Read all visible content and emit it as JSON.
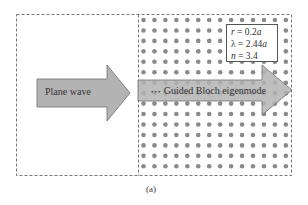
{
  "diagram": {
    "panel_caption": "(a)",
    "left_region": {
      "arrow_label": "Plane wave"
    },
    "right_region": {
      "arrow_label": "Guided Bloch eigenmode",
      "lead_dots": "•••",
      "lattice": {
        "columns": 14,
        "rows": 15,
        "dot_color": "#8a8a8a"
      }
    },
    "parameters": {
      "r": {
        "symbol": "r",
        "eq": " = 0.2",
        "unit": "a"
      },
      "lambda": {
        "symbol": "λ",
        "eq": " = 2.44",
        "unit": "a"
      },
      "n": {
        "symbol": "n",
        "eq": " = 3.4",
        "unit": ""
      }
    },
    "colors": {
      "arrow_fill": "#b3b3b3",
      "arrow_stroke": "#6e6e6e",
      "border": "#777777"
    }
  }
}
